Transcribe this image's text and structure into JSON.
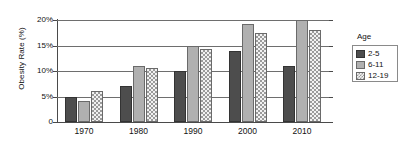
{
  "chart_data": {
    "type": "bar",
    "title": "",
    "subtitle": "",
    "xlabel": "",
    "ylabel": "Obesity Rate (%)",
    "categories": [
      "1970",
      "1980",
      "1990",
      "2000",
      "2010"
    ],
    "series": [
      {
        "name": "2-5",
        "values": [
          5.0,
          7.0,
          10.0,
          14.0,
          11.0
        ]
      },
      {
        "name": "6-11",
        "values": [
          4.2,
          11.0,
          15.0,
          19.3,
          20.0
        ]
      },
      {
        "name": "12-19",
        "values": [
          6.0,
          10.5,
          14.3,
          17.5,
          18.0
        ]
      }
    ],
    "ylim": [
      0,
      20
    ],
    "ytick_labels": [
      "0",
      "5%",
      "10%",
      "15%",
      "20%"
    ],
    "ytick_values": [
      0,
      5,
      10,
      15,
      20
    ],
    "grid": true,
    "legend_position": "right",
    "legend_title": "Age",
    "colors": {
      "series_2_5": "#4d4d4d",
      "series_6_11": "#b0b0b0",
      "series_12_19": "#f2f2f2",
      "gridline": "#6e6e6e",
      "axis": "#4a4a4a",
      "background": "#ffffff"
    }
  }
}
